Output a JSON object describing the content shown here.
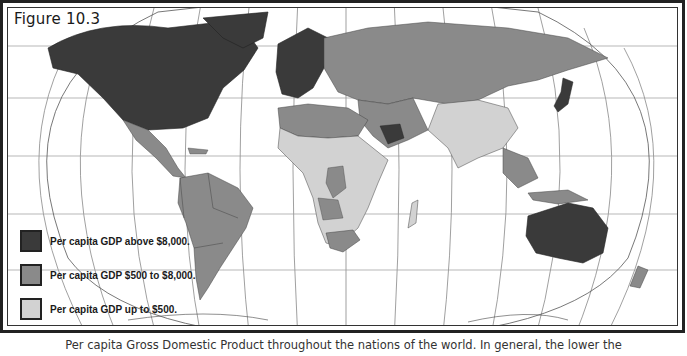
{
  "figure": {
    "title": "Figure 10.3",
    "caption": "Per capita Gross Domestic Product throughout the nations of the world. In general, the lower the"
  },
  "legend": {
    "items": [
      {
        "label": "Per capita GDP above $8,000.",
        "color": "#3a3a3a"
      },
      {
        "label": "Per capita GDP $500 to $8,000.",
        "color": "#8a8a8a"
      },
      {
        "label": "Per capita GDP up to $500.",
        "color": "#d2d2d2"
      }
    ]
  },
  "map": {
    "projection": "Robinson-style world map",
    "regions": {
      "high_income": [
        "North America (USA, Canada)",
        "Western Europe",
        "Scandinavia",
        "Japan",
        "Australia",
        "Saudi Arabia (partial)"
      ],
      "middle_income": [
        "Latin America",
        "Russia / former USSR",
        "Middle East",
        "North Africa",
        "Southern Africa",
        "China (partial)",
        "Southeast Asia (partial)",
        "New Zealand"
      ],
      "low_income": [
        "Sub-Saharan Africa",
        "India",
        "South Asia",
        "China (partial)",
        "Madagascar"
      ]
    }
  }
}
